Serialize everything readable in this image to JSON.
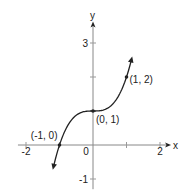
{
  "chart_data": {
    "type": "line",
    "title": "",
    "function": "y = x^3 + 1",
    "xlabel": "x",
    "ylabel": "y",
    "xlim": [
      -2.3,
      2.3
    ],
    "ylim": [
      -1.3,
      3.6
    ],
    "x_ticks": [
      -2,
      -1,
      0,
      1,
      2
    ],
    "x_tick_labels": [
      "-2",
      "",
      "0",
      "",
      "2"
    ],
    "y_ticks": [
      -1,
      1,
      2,
      3
    ],
    "y_tick_labels": [
      "-1",
      "",
      "",
      "3"
    ],
    "grid": false,
    "curve_domain": [
      -1.18,
      1.15
    ],
    "curve_arrows": "both ends",
    "points": [
      {
        "x": -1,
        "y": 0,
        "label": "(-1, 0)",
        "label_pos": "upper-left"
      },
      {
        "x": 0,
        "y": 1,
        "label": "(0, 1)",
        "label_pos": "lower-right"
      },
      {
        "x": 1,
        "y": 2,
        "label": "(1, 2)",
        "label_pos": "right"
      }
    ]
  }
}
